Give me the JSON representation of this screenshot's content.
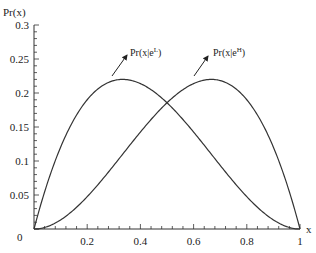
{
  "chart_data": {
    "type": "line",
    "title": "",
    "xlabel": "x",
    "ylabel": "Pr(x)",
    "xlim": [
      0,
      1
    ],
    "ylim": [
      0,
      0.3
    ],
    "grid": false,
    "legend": "annotations with arrows",
    "x_ticks": [
      0.2,
      0.4,
      0.6,
      0.8,
      1
    ],
    "x_tick_labels": [
      "0.2",
      "0.4",
      "0.6",
      "0.8",
      "1"
    ],
    "y_ticks": [
      0,
      0.05,
      0.1,
      0.15,
      0.2,
      0.25,
      0.3
    ],
    "y_tick_labels": [
      "0",
      "0.05",
      "0.1",
      "0.15",
      "0.2",
      "0.25",
      "0.3"
    ],
    "series": [
      {
        "name": "Pr(x|e^L)",
        "label_base": "Pr(x|e",
        "label_sup": "L",
        "label_close": ")",
        "formula": "k * x * (1-x)^2, peak 0.22 at x=1/3",
        "x": [
          0,
          0.1,
          0.2,
          0.3,
          0.333,
          0.4,
          0.5,
          0.6,
          0.7,
          0.8,
          0.9,
          1.0
        ],
        "values": [
          0,
          0.1203,
          0.1901,
          0.2183,
          0.22,
          0.2139,
          0.1856,
          0.1426,
          0.0936,
          0.0475,
          0.0134,
          0
        ]
      },
      {
        "name": "Pr(x|e^H)",
        "label_base": "Pr(x|e",
        "label_sup": "H",
        "label_close": ")",
        "formula": "k * x^2 * (1-x), peak 0.22 at x=2/3",
        "x": [
          0,
          0.1,
          0.2,
          0.3,
          0.4,
          0.5,
          0.6,
          0.667,
          0.7,
          0.8,
          0.9,
          1.0
        ],
        "values": [
          0,
          0.0134,
          0.0475,
          0.0936,
          0.1426,
          0.1856,
          0.2139,
          0.22,
          0.2183,
          0.1901,
          0.1203,
          0
        ]
      }
    ],
    "annotations": [
      {
        "series": "Pr(x|e^L)",
        "arrow_from": [
          0.293,
          0.225
        ],
        "arrow_to": [
          0.35,
          0.255
        ]
      },
      {
        "series": "Pr(x|e^H)",
        "arrow_from": [
          0.602,
          0.225
        ],
        "arrow_to": [
          0.654,
          0.255
        ]
      }
    ]
  },
  "axis": {
    "y_title": "Pr(x)",
    "x_title": "x",
    "zero_label": "0"
  }
}
